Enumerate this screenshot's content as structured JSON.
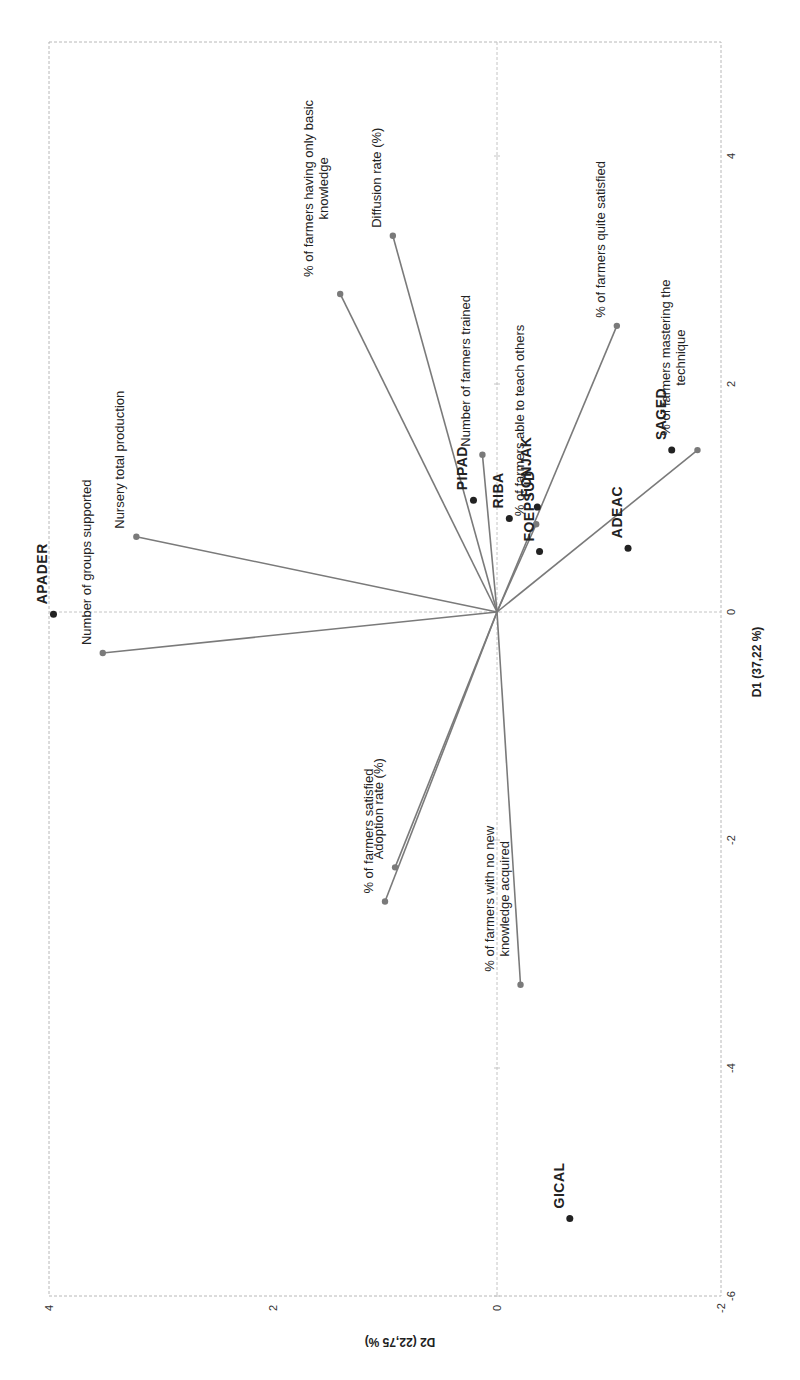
{
  "chart_data": {
    "type": "scatter",
    "subtype": "pca-biplot",
    "orientation_note": "figure rendered rotated 90 degrees counter-clockwise",
    "title": "",
    "xlabel": "D1 (37,22 %)",
    "ylabel": "D2 (22,75 %)",
    "xlim": [
      -6,
      5
    ],
    "ylim": [
      -2,
      4
    ],
    "x_ticks": [
      -6,
      -4,
      -2,
      0,
      2,
      4
    ],
    "y_ticks": [
      -2,
      0,
      2,
      4
    ],
    "grid": false,
    "legend": "none",
    "observations": [
      {
        "name": "APADER",
        "x": -0.02,
        "y": 3.96
      },
      {
        "name": "PIPAD",
        "x": 0.98,
        "y": 0.21
      },
      {
        "name": "RIBA",
        "x": 0.82,
        "y": -0.11
      },
      {
        "name": "FONJAK",
        "x": 0.92,
        "y": -0.36
      },
      {
        "name": "FOEPSUD",
        "x": 0.53,
        "y": -0.38
      },
      {
        "name": "ADEAC",
        "x": 0.56,
        "y": -1.17
      },
      {
        "name": "SAGED",
        "x": 1.42,
        "y": -1.56
      },
      {
        "name": "GICAL",
        "x": -5.32,
        "y": -0.65
      }
    ],
    "variables": [
      {
        "name": "Number of groups supported",
        "lines": [
          "Number of groups supported"
        ],
        "x": -0.36,
        "y": 3.52
      },
      {
        "name": "Nursery total production",
        "lines": [
          "Nursery total production"
        ],
        "x": 0.66,
        "y": 3.22
      },
      {
        "name": "% of farmers having only basic knowledge",
        "lines": [
          "% of farmers having only basic",
          "knowledge"
        ],
        "x": 2.79,
        "y": 1.4
      },
      {
        "name": "Diffusion rate (%)",
        "lines": [
          "Diffusion rate (%)"
        ],
        "x": 3.3,
        "y": 0.93
      },
      {
        "name": "Number of farmers trained",
        "lines": [
          "Number of farmers trained"
        ],
        "x": 1.38,
        "y": 0.13
      },
      {
        "name": "% of farmers able to teach others",
        "lines": [
          "% of farmers able to teach others"
        ],
        "x": 0.77,
        "y": -0.35
      },
      {
        "name": "% of farmers quite satisfied",
        "lines": [
          "% of farmers quite satisfied"
        ],
        "x": 2.51,
        "y": -1.07
      },
      {
        "name": "% of farmers mastering the technique",
        "lines": [
          "% of farmers mastering the",
          "technique"
        ],
        "x": 1.42,
        "y": -1.79
      },
      {
        "name": "Adoption rate (%)",
        "lines": [
          "Adoption rate (%)"
        ],
        "x": -2.24,
        "y": 0.91
      },
      {
        "name": "% of farmers satisfied",
        "lines": [
          "% of farmers satisfied"
        ],
        "x": -2.54,
        "y": 1.0
      },
      {
        "name": "% of farmers with no new knowledge acquired",
        "lines": [
          "% of farmers with no new",
          "knowledge acquired"
        ],
        "x": -3.27,
        "y": -0.21
      }
    ]
  },
  "colors": {
    "vector": "#7a7a7a",
    "observation": "#222222",
    "frame": "#b8b8b8"
  },
  "layout": {
    "origin_px": [
      497,
      612
    ],
    "px_per_unit_d1": 114,
    "px_per_unit_d2": 112
  }
}
